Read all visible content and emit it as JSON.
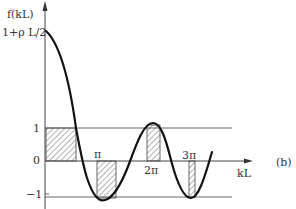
{
  "diagram": {
    "y_axis_label": "f(kL)",
    "x_axis_label": "kL",
    "y_ticks": [
      {
        "label": "1+ρ L/2",
        "value": "1+rhoL/2"
      },
      {
        "label": "1",
        "value": 1
      },
      {
        "label": "0",
        "value": 0
      },
      {
        "label": "−1",
        "value": -1
      }
    ],
    "x_ticks": [
      {
        "label": "π"
      },
      {
        "label": "2π"
      },
      {
        "label": "3π"
      }
    ],
    "panel_label": "(b)",
    "curve": "f(kL) = cos(kL) + (ρL/2) sin(kL)/(kL)",
    "allowed_bands_hatched": 4,
    "colors": {
      "line": "#111111",
      "axis": "#444444",
      "hatch": "#555555"
    }
  }
}
